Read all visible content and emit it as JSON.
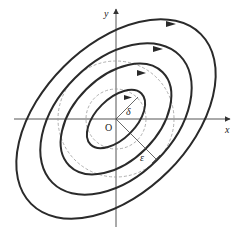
{
  "diagram": {
    "type": "phase-portrait-stability",
    "axes": {
      "x_label": "x",
      "y_label": "y",
      "origin_label": "O"
    },
    "annotations": {
      "delta_label": "δ",
      "epsilon_label": "ε"
    },
    "orbits": [
      {
        "name": "orbit-1",
        "rx": 20,
        "ry": 36
      },
      {
        "name": "orbit-2",
        "rx": 42,
        "ry": 66
      },
      {
        "name": "orbit-3",
        "rx": 58,
        "ry": 90
      },
      {
        "name": "orbit-4",
        "rx": 74,
        "ry": 120
      }
    ],
    "dashed_circles": [
      {
        "name": "delta-circle",
        "r": 30
      },
      {
        "name": "epsilon-circle",
        "r": 58
      }
    ],
    "colors": {
      "orbit": "#2a2a2a",
      "axis": "#555555",
      "dashed": "#9a9a9a"
    }
  }
}
